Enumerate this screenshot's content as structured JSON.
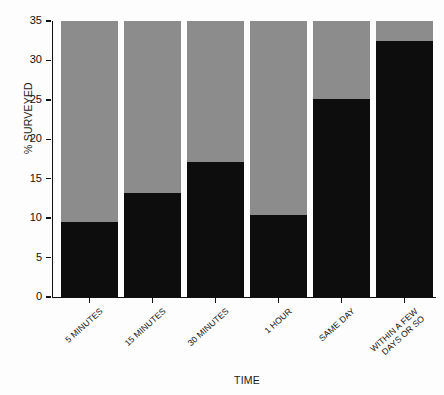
{
  "chart_data": {
    "type": "bar",
    "title": "",
    "subtitle": "",
    "xlabel": "TIME",
    "ylabel": "% SURVEYED",
    "categories": [
      "5 MINUTES",
      "15 MINUTES",
      "30 MINUTES",
      "1 HOUR",
      "SAME DAY",
      "WITHIN A FEW\nDAYS OR SO"
    ],
    "series": [
      {
        "name": "respondents",
        "color": "#0d0d0d",
        "values": [
          9.5,
          13.2,
          17.1,
          10.4,
          25.1,
          32.5
        ]
      },
      {
        "name": "remainder",
        "color": "#8c8c8c",
        "values": [
          25.5,
          21.8,
          17.9,
          24.6,
          9.9,
          2.5
        ]
      }
    ],
    "stacked": true,
    "ylim": [
      0,
      35
    ],
    "yticks": [
      0,
      5,
      10,
      15,
      20,
      25,
      30,
      35
    ],
    "ytick_labels": [
      "0",
      "5",
      "10",
      "15",
      "20",
      "25",
      "30",
      "35"
    ],
    "grid": false,
    "legend": "none",
    "background": "#fdfdfd",
    "axis_color": "#111111"
  }
}
